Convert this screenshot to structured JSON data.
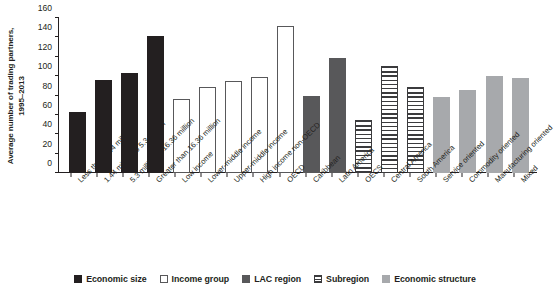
{
  "chart_data": {
    "type": "bar",
    "title": "",
    "xlabel": "",
    "ylabel": "Average number of trading partners, 1995–2013",
    "ylim": [
      0,
      160
    ],
    "yticks": [
      0,
      20,
      40,
      60,
      80,
      100,
      120,
      140,
      160
    ],
    "grid": false,
    "legend_position": "bottom",
    "categories": [
      "Less than 1.44 million",
      "1.44 million to 5.3 million",
      "5.3 million to 16.36 million",
      "Greater than 16.36 million",
      "Low income",
      "Lower-middle income",
      "Upper-middle income",
      "High income non-OECD",
      "OECD",
      "Caribbean",
      "Latin America",
      "OECS",
      "Central America",
      "South America",
      "Service oriented",
      "Commodity oriented",
      "Manufacturing oriented",
      "Mixed"
    ],
    "values": [
      63,
      96,
      103,
      141,
      76,
      89,
      95,
      99,
      152,
      79,
      119,
      55,
      110,
      89,
      78,
      86,
      100,
      98
    ],
    "groups": [
      "Economic size",
      "Economic size",
      "Economic size",
      "Economic size",
      "Income group",
      "Income group",
      "Income group",
      "Income group",
      "Income group",
      "LAC region",
      "LAC region",
      "Subregion",
      "Subregion",
      "Subregion",
      "Economic structure",
      "Economic structure",
      "Economic structure",
      "Economic structure"
    ],
    "legend": [
      {
        "label": "Economic size",
        "fill": "f-dark",
        "color": "#231f20"
      },
      {
        "label": "Income group",
        "fill": "f-white",
        "color": "#ffffff"
      },
      {
        "label": "LAC region",
        "fill": "f-midgray",
        "color": "#58585a"
      },
      {
        "label": "Subregion",
        "fill": "f-stripe",
        "color": "#3b3b3d"
      },
      {
        "label": "Economic structure",
        "fill": "f-litegray",
        "color": "#a7a9ac"
      }
    ]
  }
}
